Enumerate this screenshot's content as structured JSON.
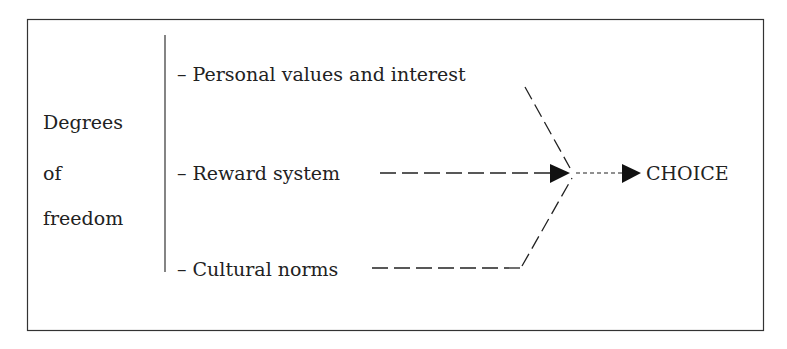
{
  "diagram": {
    "left_label": [
      "Degrees",
      "of",
      "freedom"
    ],
    "factors": [
      {
        "label": "– Personal values and interest"
      },
      {
        "label": "– Reward system"
      },
      {
        "label": "– Cultural norms"
      }
    ],
    "outcome": "CHOICE"
  }
}
